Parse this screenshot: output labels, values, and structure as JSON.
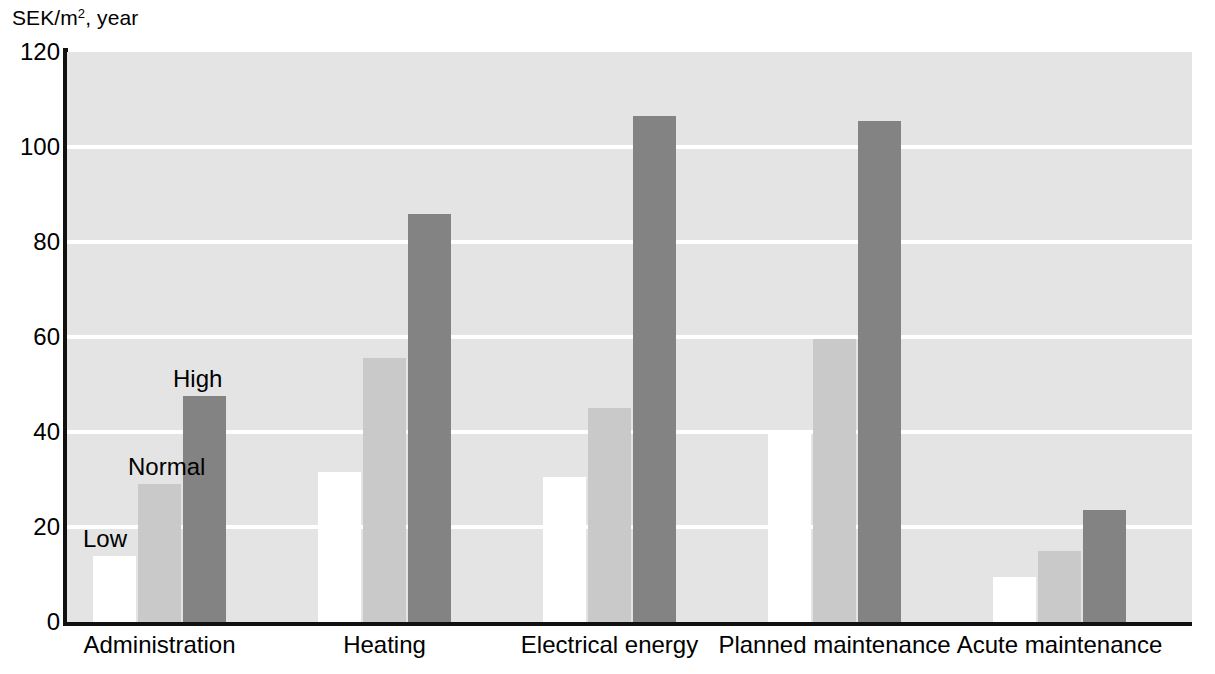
{
  "chart_data": {
    "type": "bar",
    "title": "",
    "subtitle": "",
    "xlabel": "",
    "ylabel": "SEK/m2, year",
    "ylabel_prefix": "SEK/m",
    "ylabel_superscript": "2",
    "ylabel_suffix": ", year",
    "ylim": [
      0,
      120
    ],
    "ytick_values": [
      0,
      20,
      40,
      60,
      80,
      100,
      120
    ],
    "ytick_labels": [
      "0",
      "20",
      "40",
      "60",
      "80",
      "100",
      "120"
    ],
    "grid": true,
    "grid_color": "#ffffff",
    "plot_background": "#e4e4e4",
    "legend_position": "in-plot-annotations",
    "categories": [
      "Administration",
      "Heating",
      "Electrical energy",
      "Planned maintenance",
      "Acute maintenance"
    ],
    "series": [
      {
        "name": "Low",
        "color": "#ffffff",
        "values": [
          14,
          31.5,
          30.5,
          40,
          9.5
        ]
      },
      {
        "name": "Normal",
        "color": "#c9c9c9",
        "values": [
          29,
          55.5,
          45,
          59.5,
          15
        ]
      },
      {
        "name": "High",
        "color": "#838383",
        "values": [
          47.5,
          86,
          106.5,
          105.5,
          23.5
        ]
      }
    ],
    "annotations": [
      {
        "text": "Low",
        "series": "Low",
        "category": "Administration"
      },
      {
        "text": "Normal",
        "series": "Normal",
        "category": "Administration"
      },
      {
        "text": "High",
        "series": "High",
        "category": "Administration"
      }
    ]
  }
}
